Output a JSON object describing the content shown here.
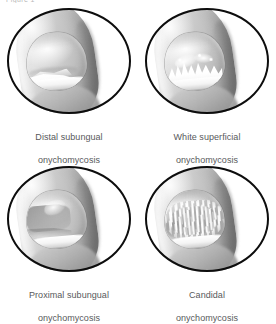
{
  "figure": {
    "top_cut_text": "Figure 1",
    "background_color": "#ffffff",
    "outline_color": "#0d0d0d",
    "caption_color": "#58595b",
    "layout": "2x2 grid of circular grayscale illustrations"
  },
  "panels": [
    {
      "id": "distal-subungual",
      "caption_line1": "Distal subungual",
      "caption_line2": "onychomycosis",
      "illustration": "big toe with thickened opaque white-yellow debris at the distal free edge of the nail plate, with distal onycholysis"
    },
    {
      "id": "white-superficial",
      "caption_line1": "White superficial",
      "caption_line2": "onychomycosis",
      "illustration": "big toe with jagged chalky white flame-shaped patches on the superficial nail plate surface"
    },
    {
      "id": "proximal-subungual",
      "caption_line1": "Proximal subungual",
      "caption_line2": "onychomycosis",
      "illustration": "big toe with dull grey-white opacity at the proximal nail plate near the lunula and cuticle"
    },
    {
      "id": "candidal",
      "caption_line1": "Candidal",
      "caption_line2": "onychomycosis",
      "illustration": "big toe with transverse ridging and white striations across the entire nail plate with proximal fold involvement"
    }
  ]
}
